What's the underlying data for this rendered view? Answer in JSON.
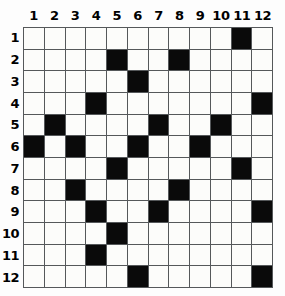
{
  "puzzle": {
    "type": "grid",
    "rows": 12,
    "columns": 12,
    "column_headers": [
      "1",
      "2",
      "3",
      "4",
      "5",
      "6",
      "7",
      "8",
      "9",
      "10",
      "11",
      "12"
    ],
    "row_headers": [
      "1",
      "2",
      "3",
      "4",
      "5",
      "6",
      "7",
      "8",
      "9",
      "10",
      "11",
      "12"
    ],
    "colors": {
      "filled_cell": "#0a0a0a",
      "empty_cell": "#fcfcfa",
      "gridline": "#55585a",
      "label_text": "#000000",
      "background": "#fdfdfd"
    },
    "cells": [
      [
        0,
        0,
        0,
        0,
        0,
        0,
        0,
        0,
        0,
        0,
        1,
        0
      ],
      [
        0,
        0,
        0,
        0,
        1,
        0,
        0,
        1,
        0,
        0,
        0,
        0
      ],
      [
        0,
        0,
        0,
        0,
        0,
        1,
        0,
        0,
        0,
        0,
        0,
        0
      ],
      [
        0,
        0,
        0,
        1,
        0,
        0,
        0,
        0,
        0,
        0,
        0,
        1
      ],
      [
        0,
        1,
        0,
        0,
        0,
        0,
        1,
        0,
        0,
        1,
        0,
        0
      ],
      [
        1,
        0,
        1,
        0,
        0,
        1,
        0,
        0,
        1,
        0,
        0,
        0
      ],
      [
        0,
        0,
        0,
        0,
        1,
        0,
        0,
        0,
        0,
        0,
        1,
        0
      ],
      [
        0,
        0,
        1,
        0,
        0,
        0,
        0,
        1,
        0,
        0,
        0,
        0
      ],
      [
        0,
        0,
        0,
        1,
        0,
        0,
        1,
        0,
        0,
        0,
        0,
        1
      ],
      [
        0,
        0,
        0,
        0,
        1,
        0,
        0,
        0,
        0,
        0,
        0,
        0
      ],
      [
        0,
        0,
        0,
        1,
        0,
        0,
        0,
        0,
        0,
        0,
        0,
        0
      ],
      [
        0,
        0,
        0,
        0,
        0,
        1,
        0,
        0,
        0,
        0,
        0,
        1
      ]
    ],
    "filled_coordinates": [
      {
        "row": 1,
        "col": 11
      },
      {
        "row": 2,
        "col": 5
      },
      {
        "row": 2,
        "col": 8
      },
      {
        "row": 3,
        "col": 6
      },
      {
        "row": 4,
        "col": 4
      },
      {
        "row": 4,
        "col": 12
      },
      {
        "row": 5,
        "col": 2
      },
      {
        "row": 5,
        "col": 7
      },
      {
        "row": 5,
        "col": 10
      },
      {
        "row": 6,
        "col": 1
      },
      {
        "row": 6,
        "col": 3
      },
      {
        "row": 6,
        "col": 6
      },
      {
        "row": 6,
        "col": 9
      },
      {
        "row": 7,
        "col": 5
      },
      {
        "row": 7,
        "col": 11
      },
      {
        "row": 8,
        "col": 3
      },
      {
        "row": 8,
        "col": 8
      },
      {
        "row": 9,
        "col": 4
      },
      {
        "row": 9,
        "col": 7
      },
      {
        "row": 9,
        "col": 12
      },
      {
        "row": 10,
        "col": 5
      },
      {
        "row": 11,
        "col": 4
      },
      {
        "row": 12,
        "col": 6
      },
      {
        "row": 12,
        "col": 12
      }
    ],
    "filled_count": 24
  }
}
